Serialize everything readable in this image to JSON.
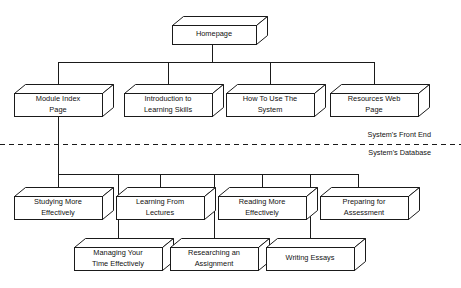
{
  "diagram": {
    "stroke_color": "#1a1a1a",
    "fill_color": "#ffffff",
    "background_color": "#ffffff",
    "divider": {
      "style": "dashed",
      "above_label": "System's Front End",
      "below_label": "System's Database"
    },
    "nodes": [
      {
        "id": "homepage",
        "label": "Homepage",
        "level": 1,
        "x": 172,
        "y": 16,
        "w": 84,
        "h": 28
      },
      {
        "id": "module-index",
        "label": "Module Index\nPage",
        "level": 2,
        "x": 14,
        "y": 84,
        "w": 88,
        "h": 32
      },
      {
        "id": "intro",
        "label": "Introduction to\nLearning Skills",
        "level": 2,
        "x": 124,
        "y": 84,
        "w": 88,
        "h": 32
      },
      {
        "id": "how-to-use",
        "label": "How To Use The\nSystem",
        "level": 2,
        "x": 226,
        "y": 84,
        "w": 88,
        "h": 32
      },
      {
        "id": "resources",
        "label": "Resources Web\nPage",
        "level": 2,
        "x": 330,
        "y": 84,
        "w": 88,
        "h": 32
      },
      {
        "id": "studying",
        "label": "Studying More\nEffectively",
        "level": 3,
        "x": 14,
        "y": 187,
        "w": 88,
        "h": 32
      },
      {
        "id": "learning",
        "label": "Learning From\nLectures",
        "level": 3,
        "x": 116,
        "y": 187,
        "w": 88,
        "h": 32
      },
      {
        "id": "reading",
        "label": "Reading More\nEffectively",
        "level": 3,
        "x": 218,
        "y": 187,
        "w": 88,
        "h": 32
      },
      {
        "id": "preparing",
        "label": "Preparing for\nAssessment",
        "level": 3,
        "x": 320,
        "y": 187,
        "w": 88,
        "h": 32
      },
      {
        "id": "managing",
        "label": "Managing Your\nTime Effectively",
        "level": 4,
        "x": 74,
        "y": 238,
        "w": 88,
        "h": 32
      },
      {
        "id": "researching",
        "label": "Researching an\nAssignment",
        "level": 4,
        "x": 170,
        "y": 238,
        "w": 88,
        "h": 32
      },
      {
        "id": "writing",
        "label": "Writing Essays",
        "level": 4,
        "x": 266,
        "y": 238,
        "w": 88,
        "h": 32
      }
    ],
    "edges": [
      {
        "from": "homepage",
        "to": "module-index"
      },
      {
        "from": "homepage",
        "to": "intro"
      },
      {
        "from": "homepage",
        "to": "how-to-use"
      },
      {
        "from": "homepage",
        "to": "resources"
      },
      {
        "from": "module-index",
        "to": "studying"
      },
      {
        "from": "module-index",
        "to": "learning"
      },
      {
        "from": "module-index",
        "to": "reading"
      },
      {
        "from": "module-index",
        "to": "preparing"
      },
      {
        "from": "module-index",
        "to": "managing"
      },
      {
        "from": "module-index",
        "to": "researching"
      },
      {
        "from": "module-index",
        "to": "writing"
      }
    ]
  }
}
